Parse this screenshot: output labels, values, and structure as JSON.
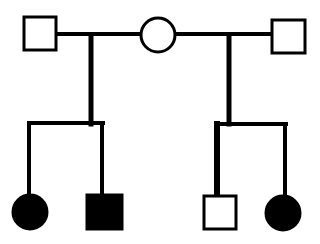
{
  "diagram": {
    "type": "pedigree",
    "colors": {
      "line": "#000000",
      "background": "#ffffff",
      "affected": "#000000",
      "unaffected": "#ffffff"
    },
    "generation_1": [
      {
        "id": "father-1",
        "sex": "male",
        "affected": false
      },
      {
        "id": "mother",
        "sex": "female",
        "affected": false
      },
      {
        "id": "father-2",
        "sex": "male",
        "affected": false
      }
    ],
    "generation_2": [
      {
        "id": "child-1",
        "sex": "female",
        "affected": true,
        "parents": [
          "father-1",
          "mother"
        ]
      },
      {
        "id": "child-2",
        "sex": "male",
        "affected": true,
        "parents": [
          "father-1",
          "mother"
        ]
      },
      {
        "id": "child-3",
        "sex": "male",
        "affected": false,
        "parents": [
          "mother",
          "father-2"
        ]
      },
      {
        "id": "child-4",
        "sex": "female",
        "affected": true,
        "parents": [
          "mother",
          "father-2"
        ]
      }
    ]
  }
}
